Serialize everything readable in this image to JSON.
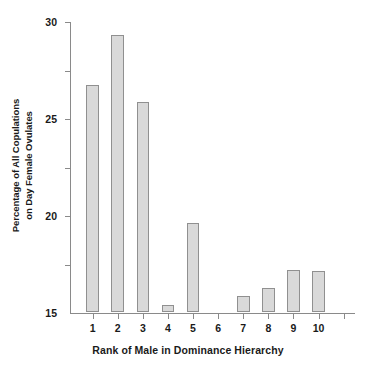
{
  "chart_data": {
    "type": "bar",
    "title": "",
    "xlabel": "Rank of Male in Dominance Hierarchy",
    "ylabel_line1": "Percentage of All Copulations",
    "ylabel_line2": "on Day Female Ovulates",
    "categories": [
      "1",
      "2",
      "3",
      "4",
      "5",
      "6",
      "7",
      "8",
      "9",
      "10"
    ],
    "values": [
      23.4,
      28.6,
      21.7,
      0.7,
      9.2,
      0.0,
      1.6,
      2.5,
      4.3,
      4.2
    ],
    "ylim": [
      0,
      30
    ],
    "yticks": [
      5,
      10,
      15,
      20,
      25,
      30
    ],
    "ytick_labels": [
      "5",
      "10",
      "15",
      "20",
      "25",
      "30"
    ],
    "grid": false,
    "legend": null,
    "bar_fill": "#d9d9d9",
    "bar_edge": "#909090",
    "axis_color": "#8a8a8a",
    "background": "#ffffff",
    "extra_xticks": 1
  }
}
